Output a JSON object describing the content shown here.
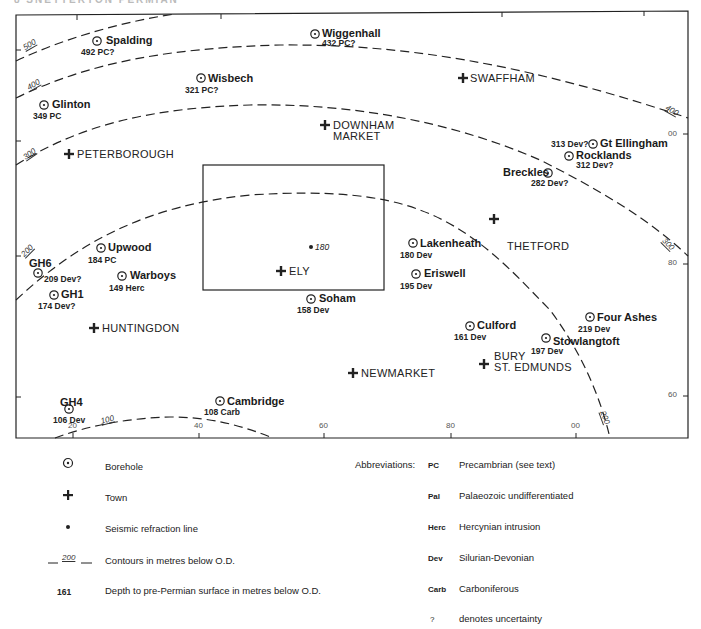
{
  "header": {
    "text": "8  SNETTERTON  PERMIAN"
  },
  "map": {
    "frame": {
      "left": 16,
      "top": 13,
      "right": 688,
      "bottom": 438
    },
    "axis_x_labels": [
      {
        "text": "20",
        "x": 73
      },
      {
        "text": "40",
        "x": 199
      },
      {
        "text": "60",
        "x": 324
      },
      {
        "text": "80",
        "x": 451
      },
      {
        "text": "00",
        "x": 576
      }
    ],
    "axis_y_labels": [
      {
        "text": "00",
        "y": 134
      },
      {
        "text": "80",
        "y": 263
      },
      {
        "text": "60",
        "y": 395
      }
    ],
    "contour_labels": [
      {
        "text": "500",
        "x": 22,
        "y": 45,
        "rot": -30
      },
      {
        "text": "400",
        "x": 26,
        "y": 85,
        "rot": -30
      },
      {
        "text": "300",
        "x": 22,
        "y": 155,
        "rot": -35
      },
      {
        "text": "200",
        "x": 20,
        "y": 253,
        "rot": -45
      },
      {
        "text": "100",
        "x": 100,
        "y": 418,
        "rot": -15
      },
      {
        "text": "400",
        "x": 668,
        "y": 104,
        "rot": 30
      },
      {
        "text": "300",
        "x": 666,
        "y": 237,
        "rot": 45
      },
      {
        "text": "200",
        "x": 606,
        "y": 410,
        "rot": 70
      }
    ],
    "boreholes": [
      {
        "name": "Spalding",
        "value": "492 PC?",
        "sym_x": 97,
        "sym_y": 41,
        "name_x": 106,
        "name_y": 35,
        "val_x": 81,
        "val_y": 48
      },
      {
        "name": "Wiggenhall",
        "value": "432 PC?",
        "sym_x": 315,
        "sym_y": 34,
        "name_x": 322,
        "name_y": 28,
        "val_x": 322,
        "val_y": 39
      },
      {
        "name": "Wisbech",
        "value": "321 PC?",
        "sym_x": 201,
        "sym_y": 78,
        "name_x": 208,
        "name_y": 73,
        "val_x": 185,
        "val_y": 86
      },
      {
        "name": "Glinton",
        "value": "349 PC",
        "sym_x": 44,
        "sym_y": 105,
        "name_x": 52,
        "name_y": 99,
        "val_x": 33,
        "val_y": 112
      },
      {
        "name": "Gt Ellingham",
        "value": "313 Dev?",
        "sym_x": 593,
        "sym_y": 144,
        "name_x": 600,
        "name_y": 138,
        "val_x": 551,
        "val_y": 140
      },
      {
        "name": "Rocklands",
        "value": "312 Dev?",
        "sym_x": 569,
        "sym_y": 156,
        "name_x": 576,
        "name_y": 150,
        "val_x": 576,
        "val_y": 161
      },
      {
        "name": "Breckles",
        "value": "282 Dev?",
        "sym_x": 548,
        "sym_y": 173,
        "name_x": 503,
        "name_y": 167,
        "val_x": 531,
        "val_y": 179
      },
      {
        "name": "Upwood",
        "value": "184 PC",
        "sym_x": 101,
        "sym_y": 248,
        "name_x": 108,
        "name_y": 242,
        "val_x": 88,
        "val_y": 256
      },
      {
        "name": "Warboys",
        "value": "149 Herc",
        "sym_x": 122,
        "sym_y": 276,
        "name_x": 130,
        "name_y": 270,
        "val_x": 109,
        "val_y": 284
      },
      {
        "name": "GH6",
        "value": "209 Dev?",
        "sym_x": 38,
        "sym_y": 273,
        "name_x": 29,
        "name_y": 258,
        "val_x": 44,
        "val_y": 275
      },
      {
        "name": "GH1",
        "value": "174 Dev?",
        "sym_x": 54,
        "sym_y": 295,
        "name_x": 61,
        "name_y": 289,
        "val_x": 38,
        "val_y": 302
      },
      {
        "name": "Soham",
        "value": "158 Dev",
        "sym_x": 311,
        "sym_y": 299,
        "name_x": 319,
        "name_y": 293,
        "val_x": 297,
        "val_y": 306
      },
      {
        "name": "Lakenheath",
        "value": "180 Dev",
        "sym_x": 413,
        "sym_y": 243,
        "name_x": 420,
        "name_y": 238,
        "val_x": 400,
        "val_y": 251
      },
      {
        "name": "Eriswell",
        "value": "195 Dev",
        "sym_x": 416,
        "sym_y": 274,
        "name_x": 424,
        "name_y": 268,
        "val_x": 400,
        "val_y": 282
      },
      {
        "name": "Culford",
        "value": "161 Dev",
        "sym_x": 470,
        "sym_y": 326,
        "name_x": 477,
        "name_y": 320,
        "val_x": 454,
        "val_y": 333
      },
      {
        "name": "Four Ashes",
        "value": "219 Dev",
        "sym_x": 590,
        "sym_y": 317,
        "name_x": 597,
        "name_y": 312,
        "val_x": 578,
        "val_y": 325
      },
      {
        "name": "Stowlangtoft",
        "value": "197 Dev",
        "sym_x": 546,
        "sym_y": 338,
        "name_x": 553,
        "name_y": 336,
        "val_x": 531,
        "val_y": 347
      },
      {
        "name": "Cambridge",
        "value": "108 Carb",
        "sym_x": 220,
        "sym_y": 401,
        "name_x": 227,
        "name_y": 396,
        "val_x": 204,
        "val_y": 408
      },
      {
        "name": "GH4",
        "value": "106 Dev",
        "sym_x": 69,
        "sym_y": 409,
        "name_x": 60,
        "name_y": 397,
        "val_x": 53,
        "val_y": 416
      }
    ],
    "towns": [
      {
        "name": "PETERBOROUGH",
        "x": 69,
        "y": 154,
        "lx": 77,
        "ly": 149
      },
      {
        "name": "DOWNHAM",
        "name2": "MARKET",
        "x": 325,
        "y": 125,
        "lx": 333,
        "ly": 120
      },
      {
        "name": "SWAFFHAM",
        "x": 463,
        "y": 78,
        "lx": 470,
        "ly": 73
      },
      {
        "name": "ELY",
        "x": 281,
        "y": 271,
        "lx": 289,
        "ly": 266
      },
      {
        "name": "THETFORD",
        "x": 494,
        "y": 219,
        "lx": 507,
        "ly": 241
      },
      {
        "name": "HUNTINGDON",
        "x": 94,
        "y": 328,
        "lx": 102,
        "ly": 323
      },
      {
        "name": "NEWMARKET",
        "x": 353,
        "y": 373,
        "lx": 361,
        "ly": 368
      },
      {
        "name": "BURY",
        "name2": "ST. EDMUNDS",
        "x": 484,
        "y": 364,
        "lx": 494,
        "ly": 351
      }
    ],
    "seismic_points": [
      {
        "value": "180",
        "x": 311,
        "y": 247
      }
    ],
    "inset_box": {
      "x": 203,
      "y": 165,
      "w": 181,
      "h": 125
    }
  },
  "legend": {
    "items": [
      {
        "symbol": "borehole",
        "label": "Borehole"
      },
      {
        "symbol": "town",
        "label": "Town"
      },
      {
        "symbol": "seismic",
        "label": "Seismic refraction line"
      },
      {
        "symbol": "contour",
        "symbol_text": "200",
        "label": "Contours in metres below O.D."
      },
      {
        "symbol": "depth",
        "symbol_text": "161",
        "label": "Depth to pre-Permian surface in metres below O.D."
      }
    ],
    "abbreviations_title": "Abbreviations:",
    "abbreviations": [
      {
        "key": "PC",
        "label": "Precambrian (see text)"
      },
      {
        "key": "Pal",
        "label": "Palaeozoic undifferentiated"
      },
      {
        "key": "Herc",
        "label": "Hercynian intrusion"
      },
      {
        "key": "Dev",
        "label": "Silurian-Devonian"
      },
      {
        "key": "Carb",
        "label": "Carboniferous"
      },
      {
        "key": "?",
        "label": "denotes uncertainty"
      }
    ]
  }
}
